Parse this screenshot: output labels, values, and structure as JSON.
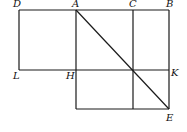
{
  "diagram": {
    "type": "geometric-figure",
    "points": {
      "D": {
        "label": "D",
        "x": 19,
        "y": 10,
        "lx": 13,
        "ly": 7
      },
      "A": {
        "label": "A",
        "x": 76,
        "y": 10,
        "lx": 72,
        "ly": 7
      },
      "C": {
        "label": "C",
        "x": 133,
        "y": 10,
        "lx": 129,
        "ly": 7
      },
      "B": {
        "label": "B",
        "x": 169,
        "y": 10,
        "lx": 166,
        "ly": 7
      },
      "L": {
        "label": "L",
        "x": 19,
        "y": 70,
        "lx": 13,
        "ly": 79
      },
      "H": {
        "label": "H",
        "x": 76,
        "y": 70,
        "lx": 66,
        "ly": 79
      },
      "K": {
        "label": "K",
        "x": 169,
        "y": 70,
        "lx": 171,
        "ly": 76
      },
      "E": {
        "label": "E",
        "x": 169,
        "y": 109,
        "lx": 166,
        "ly": 121
      }
    },
    "segments": [
      [
        "D",
        "B"
      ],
      [
        "D",
        "L"
      ],
      [
        "L",
        "K"
      ],
      [
        "B",
        "E"
      ],
      [
        "A",
        "BottomLeft"
      ],
      [
        "C",
        "BottomC"
      ],
      [
        "BottomLeft",
        "E"
      ],
      [
        "A",
        "E"
      ]
    ],
    "labels": [
      "D",
      "A",
      "C",
      "B",
      "L",
      "H",
      "K",
      "E"
    ]
  }
}
